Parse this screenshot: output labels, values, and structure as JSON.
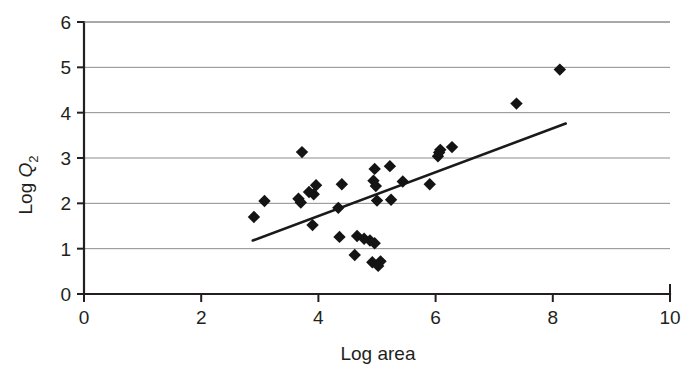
{
  "chart_data": {
    "type": "scatter",
    "title": "",
    "xlabel": "Log area",
    "ylabel": "Log Q",
    "ylabel_subscript": "2",
    "xlim": [
      0,
      10
    ],
    "ylim": [
      0,
      6
    ],
    "xticks": [
      0,
      2,
      4,
      6,
      8,
      10
    ],
    "yticks": [
      0,
      1,
      2,
      3,
      4,
      5,
      6
    ],
    "xtick_labels": [
      "0",
      "2",
      "4",
      "6",
      "8",
      "10"
    ],
    "ytick_labels": [
      "0",
      "1",
      "2",
      "3",
      "4",
      "5",
      "6"
    ],
    "grid": "horizontal",
    "legend": "none",
    "marker_style": "filled-diamond",
    "marker_color": "#141414",
    "points": [
      {
        "x": 2.9,
        "y": 1.7
      },
      {
        "x": 3.08,
        "y": 2.05
      },
      {
        "x": 3.72,
        "y": 3.13
      },
      {
        "x": 3.66,
        "y": 2.1
      },
      {
        "x": 3.7,
        "y": 2.02
      },
      {
        "x": 3.84,
        "y": 2.25
      },
      {
        "x": 3.92,
        "y": 2.2
      },
      {
        "x": 3.96,
        "y": 2.4
      },
      {
        "x": 3.9,
        "y": 1.52
      },
      {
        "x": 4.34,
        "y": 1.9
      },
      {
        "x": 4.4,
        "y": 2.42
      },
      {
        "x": 4.36,
        "y": 1.26
      },
      {
        "x": 4.62,
        "y": 0.86
      },
      {
        "x": 4.66,
        "y": 1.28
      },
      {
        "x": 4.78,
        "y": 1.22
      },
      {
        "x": 4.88,
        "y": 1.18
      },
      {
        "x": 4.96,
        "y": 1.12
      },
      {
        "x": 4.92,
        "y": 0.7
      },
      {
        "x": 5.02,
        "y": 0.62
      },
      {
        "x": 5.06,
        "y": 0.72
      },
      {
        "x": 4.96,
        "y": 2.76
      },
      {
        "x": 4.94,
        "y": 2.5
      },
      {
        "x": 4.98,
        "y": 2.38
      },
      {
        "x": 5.0,
        "y": 2.06
      },
      {
        "x": 5.22,
        "y": 2.82
      },
      {
        "x": 5.24,
        "y": 2.08
      },
      {
        "x": 5.44,
        "y": 2.48
      },
      {
        "x": 5.9,
        "y": 2.42
      },
      {
        "x": 6.04,
        "y": 3.04
      },
      {
        "x": 6.08,
        "y": 3.18
      },
      {
        "x": 6.06,
        "y": 3.12
      },
      {
        "x": 6.28,
        "y": 3.24
      },
      {
        "x": 7.38,
        "y": 4.2
      },
      {
        "x": 8.12,
        "y": 4.95
      }
    ],
    "trend_line": {
      "x0": 2.88,
      "y0": 1.18,
      "x1": 8.22,
      "y1": 3.76,
      "color": "#1a1a1a"
    }
  }
}
